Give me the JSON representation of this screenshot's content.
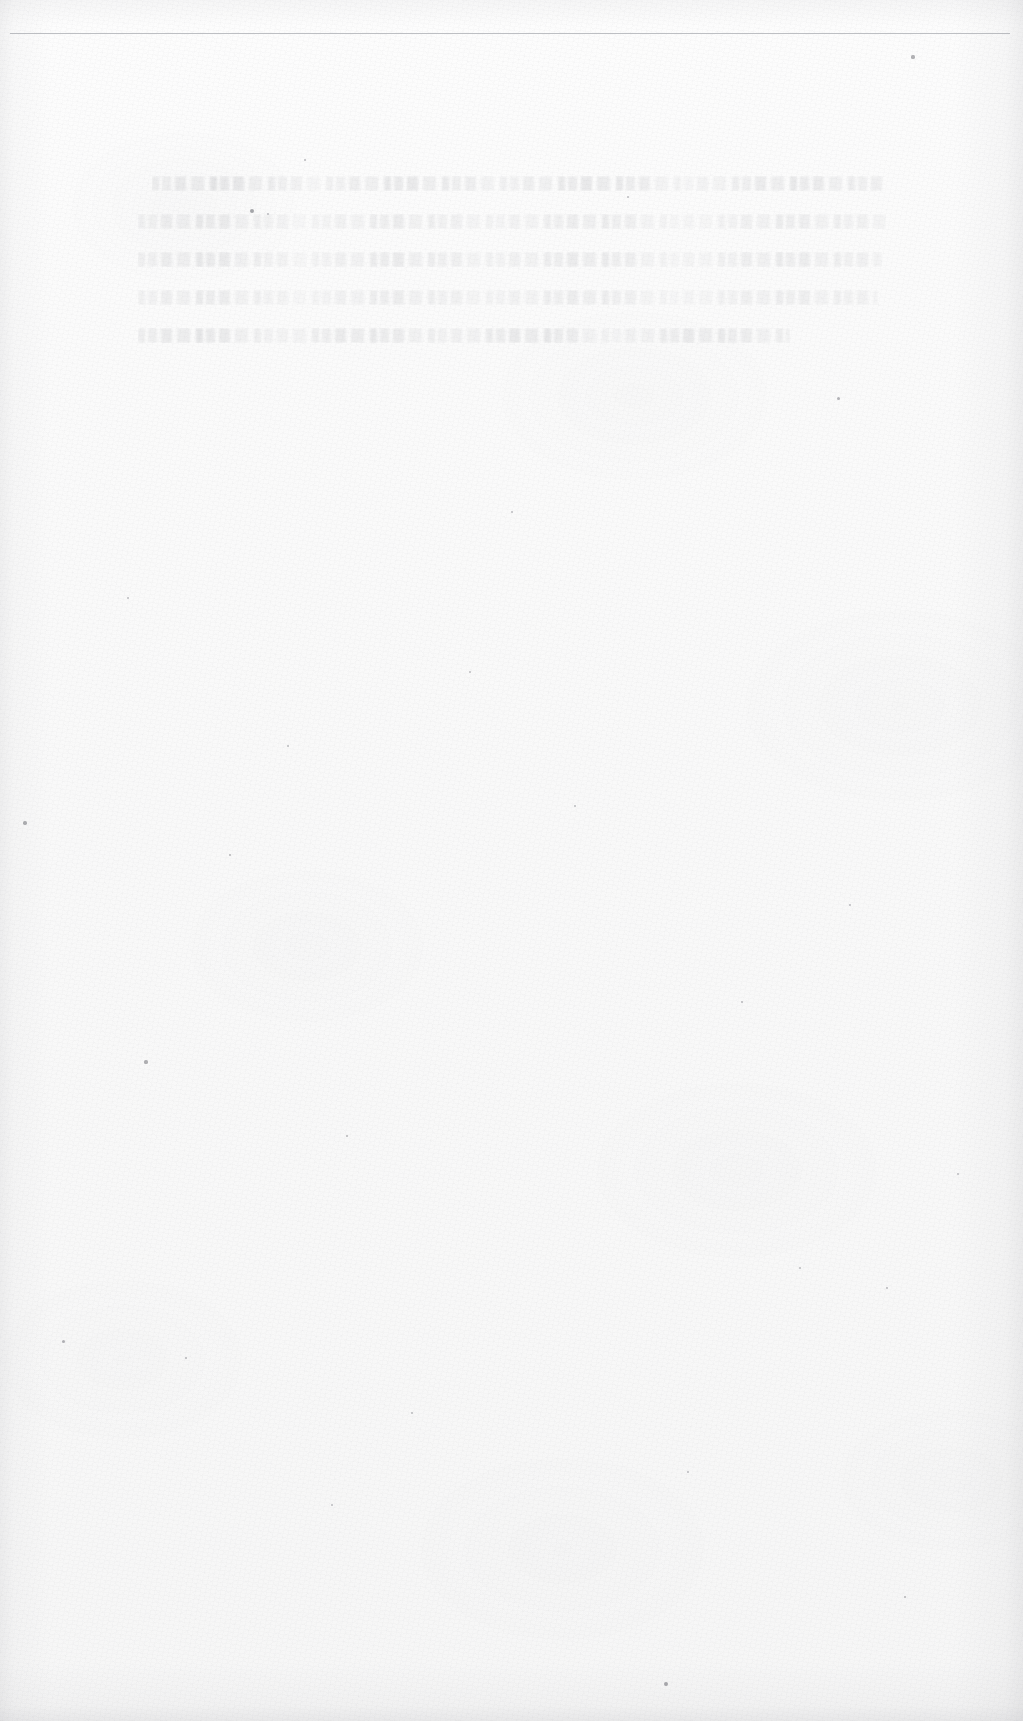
{
  "document": {
    "type": "scanned-page",
    "page_width": 1023,
    "page_height": 1721,
    "paper_color": "#fafafa",
    "condition": "blank / heavily faded — no legible printed text remains",
    "header_rule": {
      "present": true,
      "color": "#b9bcc0",
      "y": 33,
      "x_start": 10,
      "x_end": 1010,
      "thickness": 1
    },
    "text_block": {
      "legible": false,
      "note": "Ghost impressions of approximately five lines of text; ink too faded to transcribe.",
      "top": 176,
      "left": 138,
      "right": 886,
      "bottom": 392,
      "line_count": 5,
      "lines": [
        {
          "id": "line-1",
          "text": "",
          "indented": true,
          "width_px": 734
        },
        {
          "id": "line-2",
          "text": "",
          "indented": false,
          "width_px": 748
        },
        {
          "id": "line-3",
          "text": "",
          "indented": false,
          "width_px": 744
        },
        {
          "id": "line-4",
          "text": "",
          "indented": false,
          "width_px": 740
        },
        {
          "id": "line-5",
          "text": "",
          "indented": false,
          "width_px": 652
        }
      ]
    },
    "lower_region": {
      "top": 400,
      "bottom": 1721,
      "content": "blank"
    },
    "specks": [
      {
        "x": 913,
        "y": 57,
        "r": 1.6
      },
      {
        "x": 252,
        "y": 211,
        "r": 2.1
      },
      {
        "x": 268,
        "y": 214,
        "r": 1.0
      },
      {
        "x": 305,
        "y": 160,
        "r": 1.2
      },
      {
        "x": 628,
        "y": 197,
        "r": 1.0
      },
      {
        "x": 838,
        "y": 398,
        "r": 1.5
      },
      {
        "x": 25,
        "y": 823,
        "r": 1.7
      },
      {
        "x": 146,
        "y": 1062,
        "r": 1.6
      },
      {
        "x": 230,
        "y": 855,
        "r": 1.3
      },
      {
        "x": 288,
        "y": 746,
        "r": 1.1
      },
      {
        "x": 347,
        "y": 1136,
        "r": 1.3
      },
      {
        "x": 575,
        "y": 806,
        "r": 1.1
      },
      {
        "x": 512,
        "y": 512,
        "r": 1.0
      },
      {
        "x": 742,
        "y": 1002,
        "r": 1.2
      },
      {
        "x": 666,
        "y": 1684,
        "r": 1.9
      },
      {
        "x": 63,
        "y": 1341,
        "r": 1.5
      },
      {
        "x": 186,
        "y": 1358,
        "r": 1.4
      },
      {
        "x": 800,
        "y": 1268,
        "r": 1.1
      },
      {
        "x": 887,
        "y": 1288,
        "r": 1.2
      },
      {
        "x": 958,
        "y": 1174,
        "r": 1.0
      },
      {
        "x": 412,
        "y": 1413,
        "r": 1.1
      },
      {
        "x": 688,
        "y": 1472,
        "r": 1.0
      },
      {
        "x": 905,
        "y": 1597,
        "r": 1.3
      },
      {
        "x": 332,
        "y": 1505,
        "r": 1.0
      },
      {
        "x": 128,
        "y": 598,
        "r": 1.0
      },
      {
        "x": 470,
        "y": 672,
        "r": 0.9
      },
      {
        "x": 850,
        "y": 905,
        "r": 1.0
      }
    ]
  }
}
